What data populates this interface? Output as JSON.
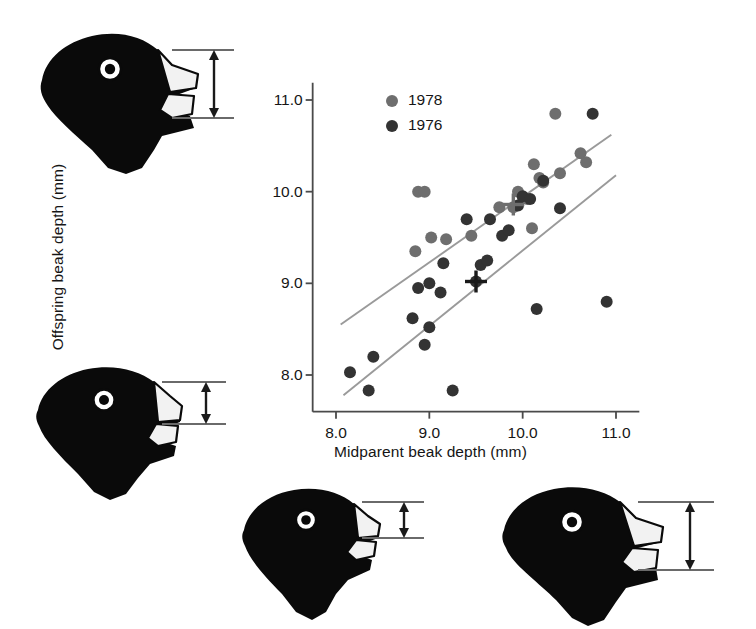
{
  "figure": {
    "name": "darwin-finch-beak-depth-heritability",
    "background": "#ffffff"
  },
  "chart_data": {
    "type": "scatter",
    "title": "",
    "xlabel": "Midparent beak depth (mm)",
    "ylabel": "Offspring beak depth (mm)",
    "xlim": [
      7.75,
      11.25
    ],
    "ylim": [
      7.6,
      11.1
    ],
    "xticks": [
      "8.0",
      "9.0",
      "10.0",
      "11.0"
    ],
    "xtick_values": [
      8.0,
      9.0,
      10.0,
      11.0
    ],
    "yticks": [
      "8.0",
      "9.0",
      "10.0",
      "11.0"
    ],
    "ytick_values": [
      8.0,
      9.0,
      10.0,
      11.0
    ],
    "grid": false,
    "legend_position": "top-left",
    "marker_radius": 6,
    "series": [
      {
        "name": "1978",
        "color": "#6e6e6e",
        "points": [
          [
            8.88,
            10.0
          ],
          [
            8.95,
            10.0
          ],
          [
            8.85,
            9.35
          ],
          [
            9.02,
            9.5
          ],
          [
            9.18,
            9.48
          ],
          [
            9.45,
            9.52
          ],
          [
            9.75,
            9.83
          ],
          [
            9.9,
            9.83
          ],
          [
            9.95,
            10.0
          ],
          [
            10.05,
            9.92
          ],
          [
            10.12,
            10.3
          ],
          [
            10.18,
            10.15
          ],
          [
            10.22,
            10.1
          ],
          [
            10.35,
            10.85
          ],
          [
            10.4,
            10.2
          ],
          [
            10.62,
            10.42
          ],
          [
            10.68,
            10.32
          ],
          [
            10.1,
            9.6
          ]
        ]
      },
      {
        "name": "1976",
        "color": "#333333",
        "points": [
          [
            8.15,
            8.03
          ],
          [
            8.35,
            7.83
          ],
          [
            8.4,
            8.2
          ],
          [
            8.82,
            8.62
          ],
          [
            8.88,
            8.95
          ],
          [
            8.95,
            8.33
          ],
          [
            9.0,
            9.0
          ],
          [
            9.0,
            8.52
          ],
          [
            9.12,
            8.9
          ],
          [
            9.15,
            9.22
          ],
          [
            9.25,
            7.83
          ],
          [
            9.4,
            9.7
          ],
          [
            9.5,
            9.02
          ],
          [
            9.55,
            9.2
          ],
          [
            9.62,
            9.25
          ],
          [
            9.65,
            9.7
          ],
          [
            9.78,
            9.52
          ],
          [
            9.85,
            9.58
          ],
          [
            9.95,
            9.85
          ],
          [
            10.0,
            9.95
          ],
          [
            10.08,
            9.92
          ],
          [
            10.15,
            8.72
          ],
          [
            10.22,
            10.12
          ],
          [
            10.4,
            9.82
          ],
          [
            10.75,
            10.85
          ],
          [
            10.9,
            8.8
          ]
        ]
      }
    ],
    "regression_lines": [
      {
        "name": "1978-regression",
        "color": "#9a9a9a",
        "x0": 8.05,
        "y0": 8.55,
        "x1": 10.95,
        "y1": 10.62
      },
      {
        "name": "1976-regression",
        "color": "#9a9a9a",
        "x0": 8.08,
        "y0": 7.78,
        "x1": 11.0,
        "y1": 10.18
      }
    ],
    "mean_markers": [
      {
        "name": "1978-mean",
        "x": 9.9,
        "y": 9.86,
        "color": "#6e6e6e"
      },
      {
        "name": "1976-mean",
        "x": 9.5,
        "y": 9.02,
        "color": "#1a1a1a"
      }
    ]
  },
  "legend": {
    "entries": [
      {
        "label": "1978",
        "color": "#6e6e6e"
      },
      {
        "label": "1976",
        "color": "#333333"
      }
    ]
  },
  "illustrations": [
    {
      "name": "finch-head-large-beak-upper-left",
      "beak_depth_relative": "large"
    },
    {
      "name": "finch-head-medium-beak-mid-left",
      "beak_depth_relative": "medium"
    },
    {
      "name": "finch-head-small-beak-bottom-mid",
      "beak_depth_relative": "small"
    },
    {
      "name": "finch-head-large-beak-bottom-right",
      "beak_depth_relative": "large"
    }
  ]
}
